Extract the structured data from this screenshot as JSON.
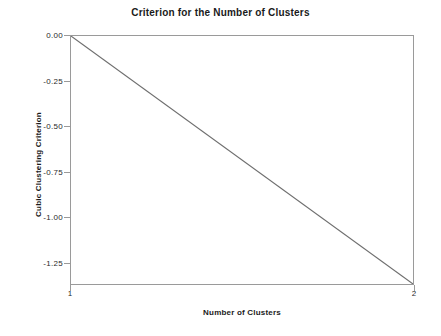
{
  "chart_data": {
    "type": "line",
    "title": "Criterion for the Number of Clusters",
    "xlabel": "Number of Clusters",
    "ylabel": "Cubic Clustering Criterion",
    "x": [
      1,
      2
    ],
    "values": [
      0.0,
      -1.37
    ],
    "series": [
      {
        "name": "Cubic Clustering Criterion",
        "x": [
          1,
          2
        ],
        "values": [
          0.0,
          -1.37
        ]
      }
    ],
    "xlim": [
      1,
      2
    ],
    "ylim": [
      -1.37,
      0.0
    ],
    "xticks": [
      1,
      2
    ],
    "xtick_labels": [
      "1",
      "2"
    ],
    "yticks": [
      0.0,
      -0.25,
      -0.5,
      -0.75,
      -1.0,
      -1.25
    ],
    "ytick_labels": [
      "0.00",
      "-0.25",
      "-0.50",
      "-0.75",
      "-1.00",
      "-1.25"
    ],
    "grid": false,
    "legend": null,
    "line_color": "#6e6e6e",
    "frame_color": "#9a9a9a",
    "background": "#ffffff"
  },
  "axes": {
    "y_ticks": [
      {
        "label": "0.00",
        "value": 0.0
      },
      {
        "label": "-0.25",
        "value": -0.25
      },
      {
        "label": "-0.50",
        "value": -0.5
      },
      {
        "label": "-0.75",
        "value": -0.75
      },
      {
        "label": "-1.00",
        "value": -1.0
      },
      {
        "label": "-1.25",
        "value": -1.25
      }
    ],
    "x_ticks": [
      {
        "label": "1",
        "value": 1
      },
      {
        "label": "2",
        "value": 2
      }
    ]
  }
}
